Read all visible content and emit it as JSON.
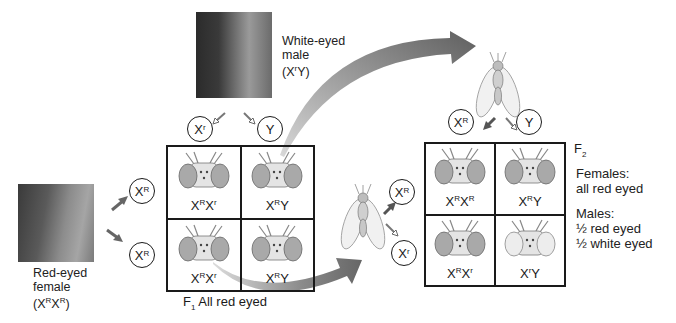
{
  "parents": {
    "male": {
      "label_line1": "White-eyed",
      "label_line2": "male",
      "genotype_prefix": "(X",
      "genotype_sup": "r",
      "genotype_suffix": "Y)",
      "photo": "white-eyed-fly-photo"
    },
    "female": {
      "label_line1": "Red-eyed",
      "label_line2": "female",
      "genotype_prefix": "(X",
      "genotype_sup1": "R",
      "genotype_mid": "X",
      "genotype_sup2": "R",
      "genotype_suffix": ")",
      "photo": "red-eyed-fly-photo"
    }
  },
  "f1": {
    "male_gametes": [
      {
        "base": "X",
        "sup": "r"
      },
      {
        "base": "Y",
        "sup": ""
      }
    ],
    "female_gametes": [
      {
        "base": "X",
        "sup": "R"
      },
      {
        "base": "X",
        "sup": "R"
      }
    ],
    "cells": [
      {
        "a": "X",
        "a_sup": "R",
        "b": "X",
        "b_sup": "r",
        "eye": "red"
      },
      {
        "a": "X",
        "a_sup": "R",
        "b": "Y",
        "b_sup": "",
        "eye": "red"
      },
      {
        "a": "X",
        "a_sup": "R",
        "b": "X",
        "b_sup": "r",
        "eye": "red"
      },
      {
        "a": "X",
        "a_sup": "R",
        "b": "Y",
        "b_sup": "",
        "eye": "red"
      }
    ],
    "caption_prefix": "F",
    "caption_sub": "1",
    "caption_text": " All red eyed"
  },
  "f2": {
    "male_gametes": [
      {
        "base": "X",
        "sup": "R"
      },
      {
        "base": "Y",
        "sup": ""
      }
    ],
    "female_gametes": [
      {
        "base": "X",
        "sup": "R"
      },
      {
        "base": "X",
        "sup": "r"
      }
    ],
    "cells": [
      {
        "a": "X",
        "a_sup": "R",
        "b": "X",
        "b_sup": "R",
        "eye": "red"
      },
      {
        "a": "X",
        "a_sup": "R",
        "b": "Y",
        "b_sup": "",
        "eye": "red"
      },
      {
        "a": "X",
        "a_sup": "R",
        "b": "X",
        "b_sup": "r",
        "eye": "red"
      },
      {
        "a": "X",
        "a_sup": "r",
        "b": "Y",
        "b_sup": "",
        "eye": "white"
      }
    ],
    "title_prefix": "F",
    "title_sub": "2",
    "females_heading": "Females:",
    "females_text": "all red eyed",
    "males_heading": "Males:",
    "males_line1": "½ red eyed",
    "males_line2": "½ white eyed"
  },
  "colors": {
    "arrow_gray": "#6e6e6e",
    "line": "#1a1a1a",
    "red_eye": "#a9a9a9",
    "white_eye": "#e6e6e6"
  }
}
